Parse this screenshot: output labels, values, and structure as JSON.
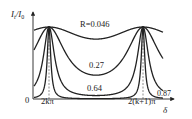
{
  "chart_data": {
    "type": "line",
    "title": "",
    "ylabel": "It/I0",
    "xlabel": "δ",
    "origin_label": "0",
    "x_tick_labels": [
      "2kπ",
      "2(k+1)π"
    ],
    "ylim": [
      0,
      1
    ],
    "function": "It/I0 = 1 / (1 + (4R/(1-R)^2) * sin^2(δ/2))",
    "series": [
      {
        "name": "R=0.046",
        "R": 0.046,
        "label": "R=0.046",
        "min_value": 0.83
      },
      {
        "name": "0.27",
        "R": 0.27,
        "label": "0.27",
        "min_value": 0.33
      },
      {
        "name": "0.64",
        "R": 0.64,
        "label": "0.64",
        "min_value": 0.05
      },
      {
        "name": "0.87",
        "R": 0.87,
        "label": "0.87",
        "min_value": 0.005
      }
    ],
    "grid": false,
    "annotations": [
      "dashed vertical lines at 2kπ and 2(k+1)π"
    ]
  },
  "axis": {
    "y_label_main": "I",
    "y_label_sub1": "t",
    "y_label_slash": "/I",
    "y_label_sub2": "0",
    "x_label": "δ",
    "origin": "0",
    "tick1": "2kπ",
    "tick2": "2(k+1)π"
  },
  "labels": {
    "r0": "R=0.046",
    "r1": "0.27",
    "r2": "0.64",
    "r3": "0.87"
  }
}
